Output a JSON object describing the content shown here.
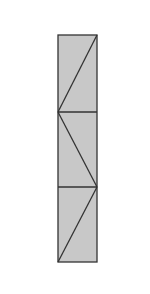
{
  "diagram": {
    "type": "geometric-figure",
    "canvas": {
      "width": 150,
      "height": 294
    },
    "colors": {
      "background": "#ffffff",
      "fill": "#c8c8c8",
      "stroke": "#333333"
    },
    "rectangle": {
      "x": 58,
      "y": 35,
      "width": 39,
      "height": 227
    },
    "dividers": [
      {
        "y": 112
      },
      {
        "y": 187
      }
    ],
    "diagonals": [
      {
        "x1": 58,
        "y1": 112,
        "x2": 97,
        "y2": 35
      },
      {
        "x1": 58,
        "y1": 112,
        "x2": 97,
        "y2": 187
      },
      {
        "x1": 58,
        "y1": 262,
        "x2": 97,
        "y2": 187
      }
    ]
  }
}
